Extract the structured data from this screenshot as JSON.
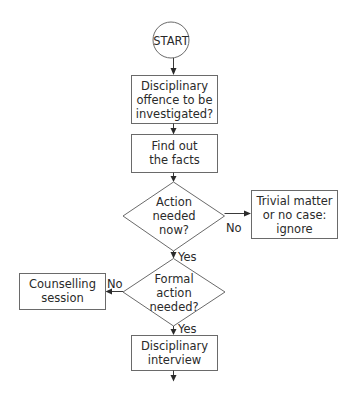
{
  "diagram": {
    "type": "flowchart",
    "colors": {
      "background": "#ffffff",
      "node_border": "#6a6a6a",
      "connector": "#3a3a3a",
      "text": "#2a2a2a"
    },
    "nodes": {
      "start": {
        "shape": "circle",
        "lines": [
          "START"
        ]
      },
      "offence": {
        "shape": "rectangle",
        "lines": [
          "Disciplinary",
          "offence to be",
          "investigated?"
        ]
      },
      "facts": {
        "shape": "rectangle",
        "lines": [
          "Find out",
          "the facts"
        ]
      },
      "action_now": {
        "shape": "diamond",
        "lines": [
          "Action",
          "needed",
          "now?"
        ]
      },
      "trivial": {
        "shape": "rectangle",
        "lines": [
          "Trivial matter",
          "or no case:",
          "ignore"
        ]
      },
      "formal_action": {
        "shape": "diamond",
        "lines": [
          "Formal",
          "action",
          "needed?"
        ]
      },
      "counselling": {
        "shape": "rectangle",
        "lines": [
          "Counselling",
          "session"
        ]
      },
      "interview": {
        "shape": "rectangle",
        "lines": [
          "Disciplinary",
          "interview"
        ]
      }
    },
    "edges": [
      {
        "from": "start",
        "to": "offence",
        "label": ""
      },
      {
        "from": "offence",
        "to": "facts",
        "label": ""
      },
      {
        "from": "facts",
        "to": "action_now",
        "label": ""
      },
      {
        "from": "action_now",
        "to": "trivial",
        "label": "No"
      },
      {
        "from": "action_now",
        "to": "formal_action",
        "label": "Yes"
      },
      {
        "from": "formal_action",
        "to": "counselling",
        "label": "No"
      },
      {
        "from": "formal_action",
        "to": "interview",
        "label": "Yes"
      },
      {
        "from": "interview",
        "to": "continuation",
        "label": ""
      }
    ],
    "labels": {
      "action_no": "No",
      "action_yes": "Yes",
      "formal_no": "No",
      "formal_yes": "Yes"
    }
  }
}
